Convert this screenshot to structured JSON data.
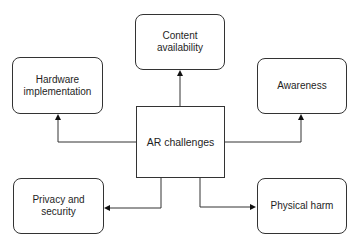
{
  "diagram": {
    "type": "hub-and-spoke flowchart",
    "center": {
      "id": "ar-challenges",
      "label": "AR challenges"
    },
    "nodes": [
      {
        "id": "content-availability",
        "label": "Content\navailability",
        "lines": [
          "Content",
          "availability"
        ]
      },
      {
        "id": "hardware-implementation",
        "label": "Hardware\nimplementation",
        "lines": [
          "Hardware",
          "implementation"
        ]
      },
      {
        "id": "awareness",
        "label": "Awareness",
        "lines": [
          "Awareness"
        ]
      },
      {
        "id": "privacy-and-security",
        "label": "Privacy and\nsecurity",
        "lines": [
          "Privacy and",
          "security"
        ]
      },
      {
        "id": "physical-harm",
        "label": "Physical harm",
        "lines": [
          "Physical harm"
        ]
      }
    ],
    "edges": [
      {
        "from": "ar-challenges",
        "to": "content-availability",
        "arrow": "target"
      },
      {
        "from": "ar-challenges",
        "to": "hardware-implementation",
        "arrow": "target"
      },
      {
        "from": "ar-challenges",
        "to": "awareness",
        "arrow": "target"
      },
      {
        "from": "ar-challenges",
        "to": "privacy-and-security",
        "arrow": "target"
      },
      {
        "from": "ar-challenges",
        "to": "physical-harm",
        "arrow": "target"
      }
    ],
    "colors": {
      "stroke": "#333333",
      "fill": "#ffffff",
      "text": "#1e1e1e"
    }
  }
}
